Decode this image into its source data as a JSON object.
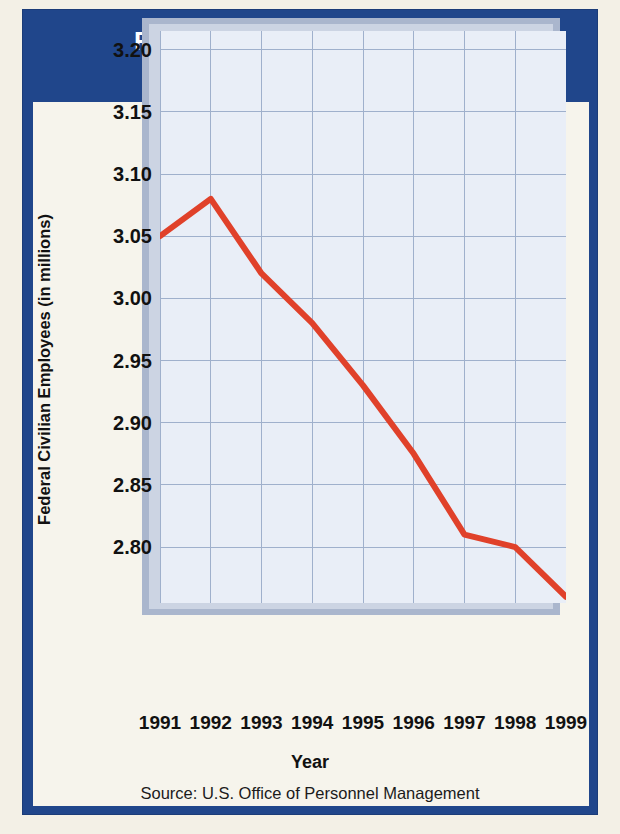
{
  "title": {
    "line1": "Federal Civilian Employment",
    "line2": "(1991–1999)"
  },
  "source_note": "Source: U.S. Office of Personnel Management",
  "colors": {
    "banner_blue": "#20468b",
    "line_red": "#e0412a",
    "plot_bg": "#e9eef7",
    "frame_gray": "#aab6cd",
    "page_bg": "#f3f0e6",
    "panel_bg": "#f6f4ec"
  },
  "chart_data": {
    "type": "line",
    "title": "Federal Civilian Employment (1991–1999)",
    "xlabel": "Year",
    "ylabel": "Federal Civilian Employees (in millions)",
    "categories": [
      "1991",
      "1992",
      "1993",
      "1994",
      "1995",
      "1996",
      "1997",
      "1998",
      "1999"
    ],
    "x": [
      1991,
      1992,
      1993,
      1994,
      1995,
      1996,
      1997,
      1998,
      1999
    ],
    "values": [
      3.05,
      3.08,
      3.02,
      2.98,
      2.93,
      2.875,
      2.81,
      2.8,
      2.76
    ],
    "series": [
      {
        "name": "Federal Civilian Employees",
        "color": "#e0412a",
        "values": [
          3.05,
          3.08,
          3.02,
          2.98,
          2.93,
          2.875,
          2.81,
          2.8,
          2.76
        ]
      }
    ],
    "ylim": [
      2.755,
      3.215
    ],
    "xlim": [
      1991,
      1999
    ],
    "yticks": [
      2.8,
      2.85,
      2.9,
      2.95,
      3.0,
      3.05,
      3.1,
      3.15,
      3.2
    ],
    "ytick_labels": [
      "2.80",
      "2.85",
      "2.90",
      "2.95",
      "3.00",
      "3.05",
      "3.10",
      "3.15",
      "3.20"
    ],
    "grid": true,
    "legend": "none",
    "units": "millions"
  }
}
